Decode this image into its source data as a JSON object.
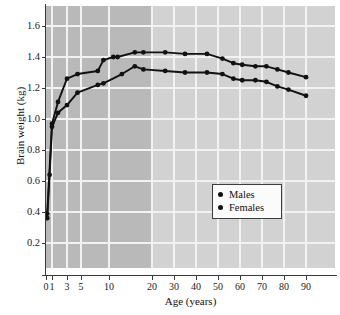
{
  "chart_data": {
    "type": "line",
    "title": "",
    "xlabel": "Age (years)",
    "ylabel": "Brain weight (kg)",
    "xticks": [
      0,
      1,
      3,
      5,
      10,
      20,
      30,
      40,
      50,
      60,
      70,
      80,
      90
    ],
    "xticklabels": [
      "0",
      "1",
      "3",
      "5",
      "10",
      "20",
      "30",
      "40",
      "50",
      "60",
      "70",
      "80",
      "90"
    ],
    "yticks": [
      0.2,
      0.4,
      0.6,
      0.8,
      1.0,
      1.2,
      1.4,
      1.6
    ],
    "yticklabels": [
      "0.2",
      "0.4",
      "0.6",
      "0.8",
      "1.0",
      "1.2",
      "1.4",
      "1.6"
    ],
    "ylim": [
      0.1,
      1.7
    ],
    "grid": true,
    "xscale": "compressed-nonlinear",
    "legend_position": "lower-right",
    "marker": "filled-circle",
    "series": [
      {
        "name": "Males",
        "color": "#111111",
        "x": [
          0.2,
          1.0,
          1.8,
          3.0,
          4.5,
          8.0,
          9.0,
          11.0,
          12.0,
          16.0,
          18.0,
          26.0,
          35.0,
          45.0,
          52.0,
          57.0,
          61.0,
          67.0,
          72.0,
          77.0,
          82.0,
          90.0
        ],
        "y": [
          0.39,
          0.97,
          1.11,
          1.26,
          1.29,
          1.31,
          1.38,
          1.4,
          1.4,
          1.43,
          1.43,
          1.43,
          1.42,
          1.42,
          1.39,
          1.36,
          1.35,
          1.34,
          1.34,
          1.32,
          1.3,
          1.27
        ]
      },
      {
        "name": "Females",
        "color": "#111111",
        "x": [
          0.2,
          0.6,
          1.0,
          1.8,
          3.0,
          4.5,
          8.0,
          9.0,
          13.0,
          16.0,
          18.0,
          26.0,
          35.0,
          45.0,
          52.0,
          57.0,
          61.0,
          67.0,
          72.0,
          77.0,
          82.0,
          90.0
        ],
        "y": [
          0.36,
          0.64,
          0.95,
          1.04,
          1.09,
          1.17,
          1.22,
          1.23,
          1.29,
          1.34,
          1.32,
          1.31,
          1.3,
          1.3,
          1.29,
          1.26,
          1.25,
          1.25,
          1.24,
          1.21,
          1.19,
          1.15
        ]
      }
    ],
    "legend": [
      {
        "label": "Males",
        "marker": "filled-circle"
      },
      {
        "label": "Females",
        "marker": "filled-circle"
      }
    ],
    "annotations": {
      "shaded_band": "darker background shading from age 0 to age 20"
    }
  }
}
